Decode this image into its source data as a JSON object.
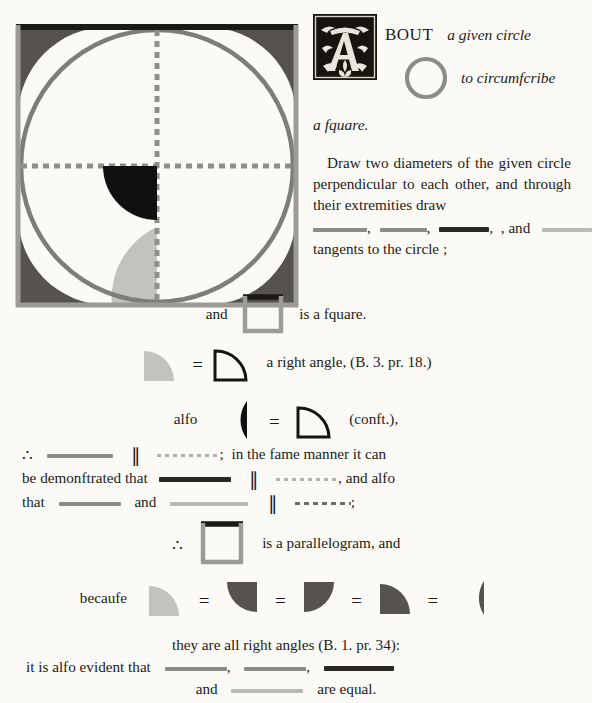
{
  "document": {
    "source": "Byrne's Euclid — Book IV, Proposition 7",
    "page_background": "#fbfaf7",
    "ink_color": "#1d1b19"
  },
  "palette": {
    "dark_gray": "#56534f",
    "mid_gray": "#8a8a88",
    "light_gray": "#b9b9b6",
    "black": "#111010",
    "circle_stroke": "#7e7d7a",
    "square_edge_gray": "#9c9b98",
    "square_edge_black": "#1a1918",
    "dashed_gray": "#8f8e8b"
  },
  "intro": {
    "initial_letter": "A",
    "initial_icon": "ornate-woodcut-initial-A",
    "line1": "BOUT",
    "line1_italic": "a given circle",
    "line2_italic": "to circumfcribe",
    "line3_italic": "a fquare.",
    "circle_icon": "open-circle-outline"
  },
  "body": {
    "paragraph": "Draw two diameters of the given circle perpendicular to each other, and through their extremities draw",
    "after_segments": ", and",
    "tangents_line": "tangents to the circle ;"
  },
  "square_line": {
    "and": "and",
    "is_a_square": "is a fquare."
  },
  "right_angle_line": {
    "text": "a right angle, (B. 3. pr. 18.)"
  },
  "also_line": {
    "also": "alfo",
    "const": "(conft.),"
  },
  "parallel_block": {
    "semicolon": ";",
    "in_the_same_manner": "in the fame manner it can",
    "be_demonstrated": "be demonftrated that",
    "and_also": ", and alfo",
    "that": "that",
    "and": "and",
    "semicolon2": ";"
  },
  "parallelogram_line": {
    "text": "is a parallelogram, and"
  },
  "because_line": {
    "because": "becaufe"
  },
  "closing": {
    "all_right_angles": "they are all right angles (B. 1. pr. 34):",
    "also_evident": "it is alfo evident that",
    "comma1": ",",
    "comma2": ",",
    "and": "and",
    "are_equal": "are equal."
  },
  "diagram": {
    "name": "circumscribed-square-about-circle",
    "square_top_edge": "black",
    "square_other_edges": "gray",
    "circle": "inscribed gray circle",
    "diameters": "two dashed gray perpendicular diameters",
    "corner_sectors": 4,
    "center_sector": "black quarter-circle",
    "bottom_sector": "light gray quarter-circle"
  },
  "symbols": {
    "therefore": "∴",
    "parallel": "∥",
    "equals": "="
  }
}
